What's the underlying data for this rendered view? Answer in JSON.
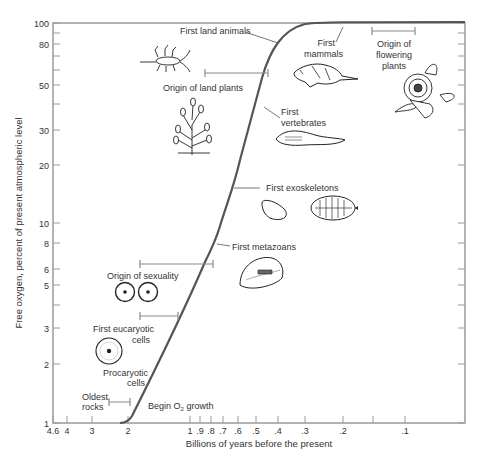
{
  "chart_data": {
    "type": "line",
    "title": "",
    "xlabel": "Billions of years before the present",
    "ylabel": "Free oxygen, percent of present atmospheric level",
    "x_scale": "log (reversed)",
    "y_scale": "log",
    "xlim": [
      4.6,
      0.07
    ],
    "ylim": [
      1,
      100
    ],
    "grid": false,
    "x_ticks": [
      "4.6",
      "4",
      "3",
      "2",
      "1",
      ".9",
      ".8",
      ".7",
      ".6",
      ".5",
      ".4",
      ".3",
      ".2",
      "",
      ".1"
    ],
    "y_ticks": [
      "1",
      "2",
      "3",
      "",
      "5",
      "6",
      "8",
      "10",
      "20",
      "30",
      "",
      "50",
      "",
      "80",
      "100"
    ],
    "series": [
      {
        "name": "Free oxygen",
        "x": [
          2.0,
          1.8,
          1.5,
          1.2,
          1.0,
          0.8,
          0.7,
          0.6,
          0.5,
          0.45,
          0.4,
          0.35,
          0.3,
          0.2,
          0.1,
          0.07
        ],
        "y": [
          1,
          1.3,
          2.2,
          3.8,
          5.5,
          8,
          10,
          14,
          25,
          35,
          55,
          80,
          97,
          100,
          100,
          100
        ]
      }
    ],
    "annotations": [
      {
        "label": "Oldest rocks",
        "range_bya": [
          3.0,
          2.1
        ]
      },
      {
        "label": "Begin O2 growth",
        "x_bya": 2.0
      },
      {
        "label": "Procaryotic cells",
        "x_bya": 1.8
      },
      {
        "label": "First eucaryotic cells",
        "range_bya": [
          1.6,
          1.2
        ]
      },
      {
        "label": "Origin of sexuality",
        "range_bya": [
          1.6,
          0.8
        ]
      },
      {
        "label": "First metazoans",
        "x_bya": 0.75
      },
      {
        "label": "First exoskeletons",
        "x_bya": 0.6
      },
      {
        "label": "First vertebrates",
        "x_bya": 0.45
      },
      {
        "label": "Origin of land plants",
        "range_bya": [
          0.55,
          0.42
        ]
      },
      {
        "label": "First land animals",
        "x_bya": 0.4
      },
      {
        "label": "First mammals",
        "x_bya": 0.2
      },
      {
        "label": "Origin of flowering plants",
        "range_bya": [
          0.15,
          0.1
        ]
      }
    ]
  },
  "axes": {
    "xlabel": "Billions of years before the present",
    "ylabel": "Free oxygen, percent of present atmospheric level",
    "x_ticks": [
      {
        "label": "4.6",
        "x": 53
      },
      {
        "label": "4",
        "x": 67
      },
      {
        "label": "3",
        "x": 92
      },
      {
        "label": "2",
        "x": 128
      },
      {
        "label": "1",
        "x": 190
      },
      {
        "label": ".9",
        "x": 200
      },
      {
        "label": ".8",
        "x": 211
      },
      {
        "label": ".7",
        "x": 223
      },
      {
        "label": ".6",
        "x": 238
      },
      {
        "label": ".5",
        "x": 256
      },
      {
        "label": ".4",
        "x": 278
      },
      {
        "label": ".3",
        "x": 305
      },
      {
        "label": ".2",
        "x": 343
      },
      {
        "label": "",
        "x": 373
      },
      {
        "label": ".1",
        "x": 405
      }
    ],
    "y_ticks": [
      {
        "label": "100",
        "y": 23
      },
      {
        "label": "",
        "y": 33
      },
      {
        "label": "80",
        "y": 44
      },
      {
        "label": "",
        "y": 56
      },
      {
        "label": "",
        "y": 70
      },
      {
        "label": "50",
        "y": 85
      },
      {
        "label": "",
        "y": 104
      },
      {
        "label": "30",
        "y": 130
      },
      {
        "label": "20",
        "y": 165
      },
      {
        "label": "10",
        "y": 223
      },
      {
        "label": "8",
        "y": 243
      },
      {
        "label": "6",
        "y": 269
      },
      {
        "label": "5",
        "y": 285
      },
      {
        "label": "",
        "y": 305
      },
      {
        "label": "3",
        "y": 328
      },
      {
        "label": "2",
        "y": 364
      },
      {
        "label": "1",
        "y": 423
      }
    ]
  },
  "labels": {
    "first_land_animals": "First land animals",
    "first_mammals_1": "First",
    "first_mammals_2": "mammals",
    "origin_flowering_1": "Origin of",
    "origin_flowering_2": "flowering",
    "origin_flowering_3": "plants",
    "origin_land_plants": "Origin of land plants",
    "first_vertebrates_1": "First",
    "first_vertebrates_2": "vertebrates",
    "first_exoskeletons": "First exoskeletons",
    "first_metazoans": "First metazoans",
    "origin_sexuality": "Origin of sexuality",
    "first_eucaryotic_1": "First eucaryotic",
    "first_eucaryotic_2": "cells",
    "procaryotic_1": "Procaryotic",
    "procaryotic_2": "cells",
    "oldest_rocks_1": "Oldest",
    "oldest_rocks_2": "rocks",
    "begin_o2": "Begin O",
    "begin_o2_sub": "2",
    "begin_o2_tail": " growth"
  },
  "colors": {
    "axis": "#9a9a9a",
    "curve": "#555555",
    "text": "#333333",
    "bracket": "#8a8a8a"
  }
}
